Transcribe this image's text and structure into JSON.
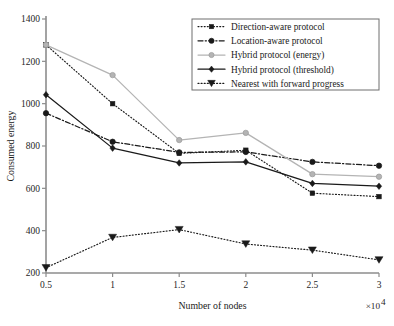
{
  "chart_data": {
    "type": "line",
    "title": "",
    "xlabel": "Number of nodes",
    "ylabel": "Consumed energy",
    "x_multiplier": "×10",
    "x_multiplier_exp": "4",
    "x": [
      0.5,
      1,
      1.5,
      2,
      2.5,
      3
    ],
    "xticklabels": [
      "0.5",
      "1",
      "1.5",
      "2",
      "2.5",
      "3"
    ],
    "xlim": [
      0.5,
      3
    ],
    "ylim": [
      200,
      1400
    ],
    "yticks": [
      200,
      400,
      600,
      800,
      1000,
      1200,
      1400
    ],
    "yticklabels": [
      "200",
      "400",
      "600",
      "800",
      "1000",
      "1200",
      "1400"
    ],
    "grid": false,
    "legend_position": "upper right",
    "series": [
      {
        "name": "Direction-aware protocol",
        "values": [
          1278,
          1000,
          765,
          780,
          577,
          561
        ],
        "marker": "square",
        "linestyle": "dotted",
        "color": "#1a1a1a"
      },
      {
        "name": "Location-aware protocol",
        "values": [
          955,
          820,
          770,
          772,
          725,
          707
        ],
        "marker": "circle",
        "linestyle": "dashdot",
        "color": "#1a1a1a"
      },
      {
        "name": "Hybrid protocol (energy)",
        "values": [
          1278,
          1135,
          828,
          862,
          667,
          655
        ],
        "marker": "circle",
        "linestyle": "solid",
        "color": "#b4b4b4"
      },
      {
        "name": "Hybrid protocol (threshold)",
        "values": [
          1042,
          790,
          720,
          725,
          623,
          610
        ],
        "marker": "diamond",
        "linestyle": "solid",
        "color": "#1a1a1a"
      },
      {
        "name": "Nearest with forward progress",
        "values": [
          225,
          368,
          405,
          337,
          308,
          262
        ],
        "marker": "triangle-down",
        "linestyle": "dotted",
        "color": "#1a1a1a"
      }
    ]
  },
  "legend": {
    "items": [
      "Direction-aware protocol",
      "Location-aware protocol",
      "Hybrid protocol (energy)",
      "Hybrid protocol (threshold)",
      "Nearest with forward progress"
    ]
  }
}
